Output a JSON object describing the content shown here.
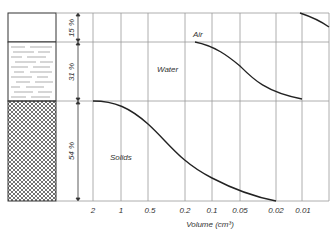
{
  "diagram": {
    "type": "soil-phase-composition",
    "column": {
      "phases": [
        {
          "name": "Air",
          "percent_label": "15 %",
          "pattern": "empty"
        },
        {
          "name": "Water",
          "percent_label": "31 %",
          "pattern": "dashes"
        },
        {
          "name": "Solids",
          "percent_label": "54 %",
          "pattern": "crosshatch"
        }
      ]
    },
    "curve_labels": {
      "air": "Air",
      "water": "Water",
      "solids": "Solids"
    },
    "x_axis": {
      "label": "Volume (cm³)",
      "ticks": [
        "2",
        "1",
        "0.5",
        "0.2",
        "0.1",
        "0.05",
        "0.02",
        "0.01"
      ]
    },
    "colors": {
      "line": "#222222",
      "grid": "#9a9a9a",
      "text": "#333333"
    }
  }
}
